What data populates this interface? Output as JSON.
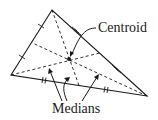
{
  "diagram": {
    "labels": {
      "centroid": "Centroid",
      "medians": "Medians"
    },
    "vertices": {
      "top": [
        52,
        10
      ],
      "left": [
        11,
        75
      ],
      "right": [
        147,
        96
      ]
    },
    "centroid_point": [
      70,
      60
    ],
    "colors": {
      "stroke": "#1a1a1a",
      "background": "#ffffff"
    }
  }
}
